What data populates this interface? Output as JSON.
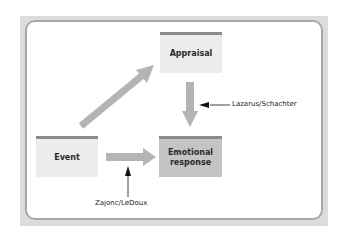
{
  "diagram": {
    "nodes": {
      "appraisal": "Appraisal",
      "event": "Event",
      "emotional_response_line1": "Emotional",
      "emotional_response_line2": "response"
    },
    "annotations": {
      "cognitive_route": "Lazarus/Schachter",
      "direct_route": "Zajonc/LeDoux"
    },
    "edges": [
      {
        "from": "Event",
        "to": "Appraisal"
      },
      {
        "from": "Appraisal",
        "to": "Emotional response",
        "annotation": "Lazarus/Schachter"
      },
      {
        "from": "Event",
        "to": "Emotional response",
        "annotation": "Zajonc/LeDoux"
      }
    ],
    "colors": {
      "box_light": "#ececec",
      "box_dark": "#c4c4c4",
      "box_top_bar": "#8a8a8a",
      "arrow": "#b4b4b4",
      "frame": "#a8a8a8"
    }
  }
}
